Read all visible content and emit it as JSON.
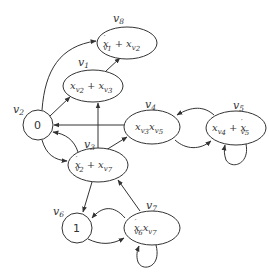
{
  "diagram": {
    "type": "directed-graph",
    "stroke_color": "#333333",
    "background": "#ffffff",
    "nodes": [
      {
        "id": "v1",
        "label": "v1",
        "label_main": "v",
        "label_sub": "1",
        "shape": "ellipse",
        "content": "x_{v2} + x_{v3}"
      },
      {
        "id": "v2",
        "label": "v2",
        "label_main": "v",
        "label_sub": "2",
        "shape": "circle",
        "content": "0"
      },
      {
        "id": "v3",
        "label": "v3",
        "label_main": "v",
        "label_sub": "3",
        "shape": "ellipse",
        "content": "x'_{v2} + x_{v7}"
      },
      {
        "id": "v4",
        "label": "v4",
        "label_main": "v",
        "label_sub": "4",
        "shape": "ellipse",
        "content": "x_{v3} x_{v5}"
      },
      {
        "id": "v5",
        "label": "v5",
        "label_main": "v",
        "label_sub": "5",
        "shape": "ellipse",
        "content": "x_{v4} + x'_{v5}"
      },
      {
        "id": "v6",
        "label": "v6",
        "label_main": "v",
        "label_sub": "6",
        "shape": "circle",
        "content": "1"
      },
      {
        "id": "v7",
        "label": "v7",
        "label_main": "v",
        "label_sub": "7",
        "shape": "ellipse",
        "content": "x'_{v6} x_{v7}"
      },
      {
        "id": "v8",
        "label": "v8",
        "label_main": "v",
        "label_sub": "8",
        "shape": "ellipse",
        "content": "x'_{v1} + x_{v2}"
      }
    ],
    "edges": [
      {
        "from": "v2",
        "to": "v8"
      },
      {
        "from": "v1",
        "to": "v8"
      },
      {
        "from": "v2",
        "to": "v1"
      },
      {
        "from": "v3",
        "to": "v1"
      },
      {
        "from": "v4",
        "to": "v2"
      },
      {
        "from": "v3",
        "to": "v2"
      },
      {
        "from": "v2",
        "to": "v3"
      },
      {
        "from": "v3",
        "to": "v4"
      },
      {
        "from": "v5",
        "to": "v4"
      },
      {
        "from": "v4",
        "to": "v5"
      },
      {
        "from": "v5",
        "to": "v5"
      },
      {
        "from": "v3",
        "to": "v6"
      },
      {
        "from": "v7",
        "to": "v3"
      },
      {
        "from": "v7",
        "to": "v6"
      },
      {
        "from": "v6",
        "to": "v7"
      },
      {
        "from": "v7",
        "to": "v7"
      }
    ],
    "text": {
      "x": "x",
      "v": "v",
      "plus": "+",
      "prime": "′",
      "zero": "0",
      "one": "1",
      "s1": "1",
      "s2": "2",
      "s3": "3",
      "s4": "4",
      "s5": "5",
      "s6": "6",
      "s7": "7",
      "s8": "8"
    }
  }
}
